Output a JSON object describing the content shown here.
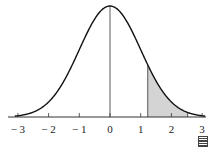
{
  "chart_data": {
    "type": "area",
    "title": "",
    "xlabel": "",
    "ylabel": "",
    "x_ticks": [
      -3,
      -2,
      -1,
      0,
      1,
      2,
      3
    ],
    "x_tick_labels": [
      "− 3",
      "− 2",
      "− 1",
      "0",
      "1",
      "2",
      "3"
    ],
    "xlim": [
      -3,
      3
    ],
    "shaded_region": {
      "from": 1.23,
      "to": 2.53
    },
    "vertical_line_at": 0,
    "grid": false,
    "colors": {
      "curve": "#111111",
      "shade": "#d4d4d4",
      "axis": "#333333"
    }
  },
  "icon": "table-icon"
}
